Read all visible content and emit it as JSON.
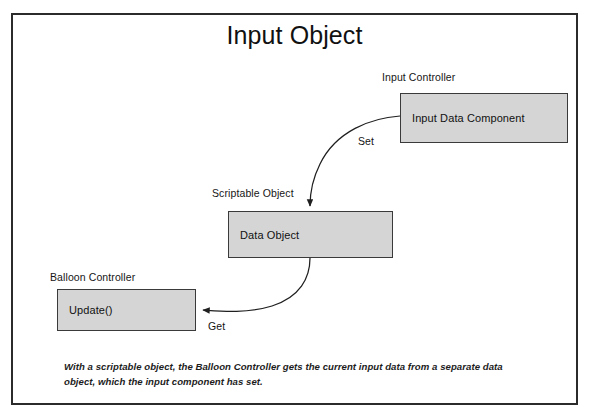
{
  "diagram": {
    "title": "Input Object",
    "frame_border_color": "#2b2b2b",
    "box_fill_color": "#d5d5d5",
    "box_border_color": "#3a3a3a",
    "background_color": "#ffffff",
    "groups": [
      {
        "id": "input-controller",
        "label": "Input Controller"
      },
      {
        "id": "scriptable-object",
        "label": "Scriptable Object"
      },
      {
        "id": "balloon-controller",
        "label": "Balloon Controller"
      }
    ],
    "nodes": [
      {
        "id": "input-data-component",
        "label": "Input Data Component",
        "group": "input-controller"
      },
      {
        "id": "data-object",
        "label": "Data Object",
        "group": "scriptable-object"
      },
      {
        "id": "update",
        "label": "Update()",
        "group": "balloon-controller"
      }
    ],
    "edges": [
      {
        "id": "set",
        "label": "Set",
        "from": "input-data-component",
        "to": "data-object"
      },
      {
        "id": "get",
        "label": "Get",
        "from": "data-object",
        "to": "update"
      }
    ],
    "caption": "With a scriptable object, the Balloon Controller gets the current input data from a separate data object, which the input component has set."
  }
}
